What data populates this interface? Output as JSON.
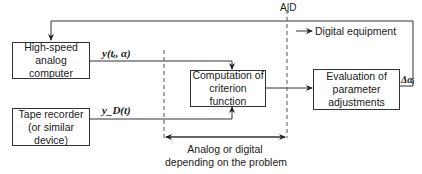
{
  "diagram": {
    "type": "block-diagram",
    "blocks": {
      "analog_computer": {
        "line1": "High-speed",
        "line2": "analog computer"
      },
      "tape_recorder": {
        "line1": "Tape recorder",
        "line2": "(or similar device)"
      },
      "criterion": {
        "line1": "Computation of",
        "line2": "criterion function"
      },
      "evaluation": {
        "line1": "Evaluation of",
        "line2": "parameter",
        "line3": "adjustments"
      }
    },
    "signals": {
      "y_model": "y(tᵢ, α)",
      "y_desired": "y_D(t)",
      "delta_alpha": "Δαᵢ"
    },
    "labels": {
      "ad_boundary": "A|D",
      "digital_equipment": "Digital equipment",
      "analog_or_digital_line1": "Analog or digital",
      "analog_or_digital_line2": "depending on the problem"
    }
  }
}
